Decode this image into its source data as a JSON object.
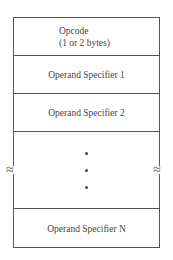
{
  "diagram": {
    "fields": [
      {
        "label": "Opcode",
        "sublabel": "(1 or 2 bytes)"
      },
      {
        "label": "Operand Specifier 1"
      },
      {
        "label": "Operand Specifier 2"
      },
      {
        "label": "⋮",
        "type": "ellipsis"
      },
      {
        "label": "Operand Specifier N"
      }
    ],
    "break_symbol": "≈"
  }
}
